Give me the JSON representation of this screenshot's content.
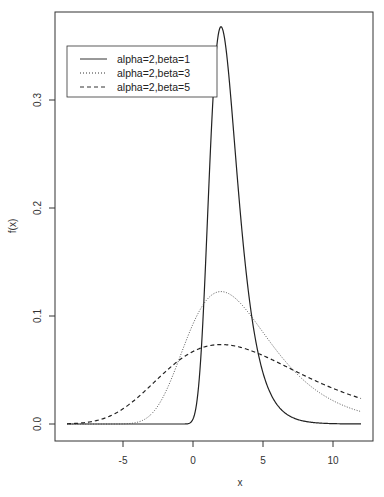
{
  "chart_data": {
    "type": "line",
    "title": "",
    "xlabel": "x",
    "ylabel": "f(x)",
    "xlim": [
      -9,
      12
    ],
    "ylim": [
      0,
      0.367
    ],
    "x_ticks": [
      -5,
      0,
      5,
      10
    ],
    "x_tick_labels": [
      "-5",
      "0",
      "5",
      "10"
    ],
    "y_ticks": [
      0.0,
      0.1,
      0.2,
      0.3
    ],
    "y_tick_labels": [
      "0.0",
      "0.1",
      "0.2",
      "0.3"
    ],
    "grid": false,
    "legend_position": "top-left",
    "distribution": "Gumbel (location alpha, scale beta)",
    "series": [
      {
        "name": "alpha=2,beta=1",
        "alpha": 2,
        "beta": 1,
        "line_style": "solid",
        "color": "#222222",
        "peak": 0.368
      },
      {
        "name": "alpha=2,beta=3",
        "alpha": 2,
        "beta": 3,
        "line_style": "dotted",
        "color": "#444444",
        "peak": 0.123
      },
      {
        "name": "alpha=2,beta=5",
        "alpha": 2,
        "beta": 5,
        "line_style": "dashed",
        "color": "#222222",
        "peak": 0.074
      }
    ],
    "sample_points": {
      "x": [
        -9,
        -6,
        -4,
        -2,
        0,
        1,
        2,
        3,
        4,
        6,
        8,
        10,
        12
      ],
      "alpha=2,beta=1": [
        0.0,
        0.0,
        0.0,
        0.0,
        0.051,
        0.179,
        0.368,
        0.255,
        0.118,
        0.018,
        0.002,
        0.0,
        0.0
      ],
      "alpha=2,beta=3": [
        0.0,
        0.0,
        0.004,
        0.029,
        0.086,
        0.111,
        0.123,
        0.118,
        0.107,
        0.079,
        0.055,
        0.036,
        0.013
      ],
      "alpha=2,beta=5": [
        0.003,
        0.017,
        0.031,
        0.047,
        0.066,
        0.071,
        0.074,
        0.073,
        0.071,
        0.066,
        0.058,
        0.05,
        0.024
      ]
    }
  },
  "legend": {
    "items": [
      {
        "label": "alpha=2,beta=1",
        "dash": ""
      },
      {
        "label": "alpha=2,beta=3",
        "dash": "1,2"
      },
      {
        "label": "alpha=2,beta=5",
        "dash": "4,3"
      }
    ]
  },
  "axes": {
    "x_title": "x",
    "y_title": "f(x)"
  }
}
